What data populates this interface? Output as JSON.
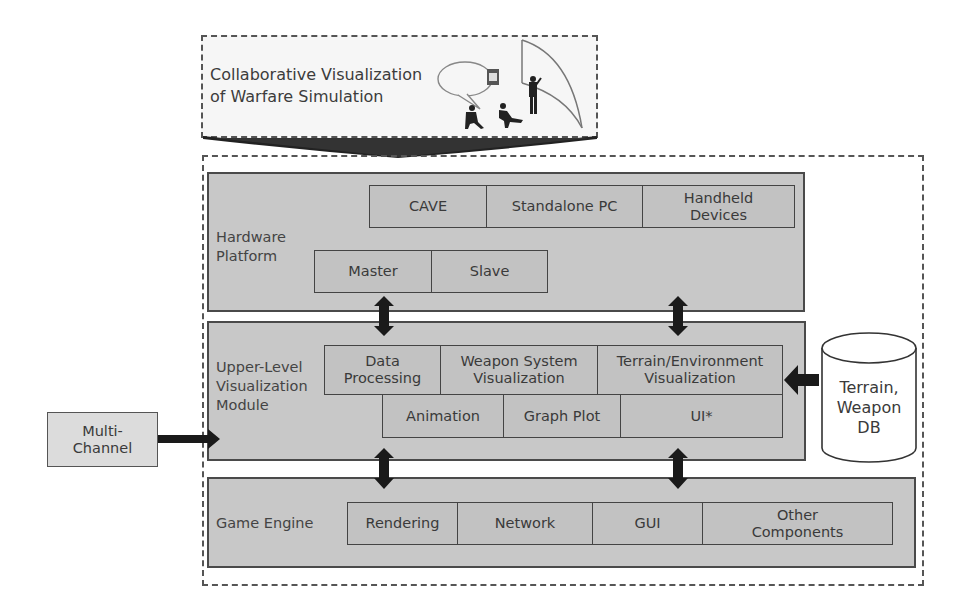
{
  "header": {
    "title_line1": "Collaborative Visualization",
    "title_line2": "of Warfare Simulation"
  },
  "hardware": {
    "label_line1": "Hardware",
    "label_line2": "Platform",
    "items": [
      {
        "line1": "CAVE",
        "line2": ""
      },
      {
        "line1": "Standalone PC",
        "line2": ""
      },
      {
        "line1": "Handheld",
        "line2": "Devices"
      }
    ],
    "cave_children": [
      "Master",
      "Slave"
    ]
  },
  "upper": {
    "label_line1": "Upper-Level",
    "label_line2": "Visualization",
    "label_line3": "Module",
    "row1": [
      {
        "line1": "Data",
        "line2": "Processing"
      },
      {
        "line1": "Weapon System",
        "line2": "Visualization"
      },
      {
        "line1": "Terrain/Environment",
        "line2": "Visualization"
      }
    ],
    "row2": [
      "Animation",
      "Graph Plot",
      "UI*"
    ]
  },
  "engine": {
    "label": "Game Engine",
    "items": [
      {
        "line1": "Rendering",
        "line2": ""
      },
      {
        "line1": "Network",
        "line2": ""
      },
      {
        "line1": "GUI",
        "line2": ""
      },
      {
        "line1": "Other",
        "line2": "Components"
      }
    ]
  },
  "external": {
    "multichannel_line1": "Multi-",
    "multichannel_line2": "Channel",
    "db_line1": "Terrain,",
    "db_line2": "Weapon",
    "db_line3": "DB"
  },
  "colors": {
    "panel_fill": "#c8c8c8",
    "cell_fill": "#c2c2c2",
    "arrow": "#1a1a1a",
    "border": "#444444"
  }
}
